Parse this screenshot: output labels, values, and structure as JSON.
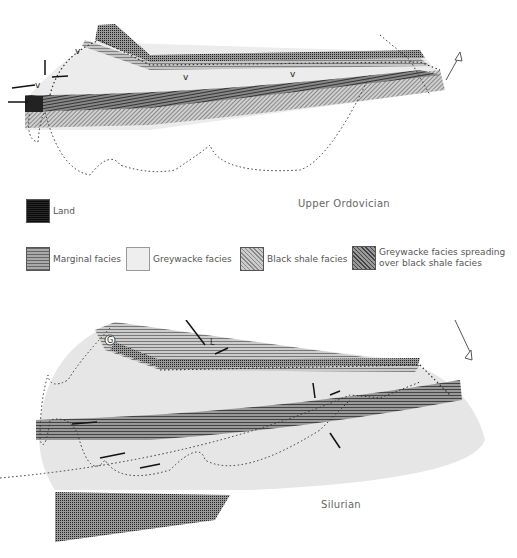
{
  "figure": {
    "maps": [
      {
        "id": "upper",
        "period_label": "Upper Ordovician"
      },
      {
        "id": "lower",
        "period_label": "Silurian"
      }
    ],
    "legend": [
      {
        "key": "land",
        "label": "Land"
      },
      {
        "key": "marginal",
        "label": "Marginal facies"
      },
      {
        "key": "greywacke",
        "label": "Greywacke facies"
      },
      {
        "key": "black_shale",
        "label": "Black shale facies"
      },
      {
        "key": "spreading",
        "label_line1": "Greywacke facies spreading",
        "label_line2": "over black shale facies"
      }
    ],
    "map_symbols": {
      "north_arrow": "N",
      "upper_marks": [
        "V",
        "V",
        "V",
        "V"
      ],
      "lower_marks": [
        "G",
        "L"
      ]
    },
    "colors": {
      "land": "#555555",
      "marginal": "#8a8a8a",
      "greywacke": "#e8e8e8",
      "black_shale": "#b0b0b0",
      "spreading": "#6e6e6e"
    }
  }
}
